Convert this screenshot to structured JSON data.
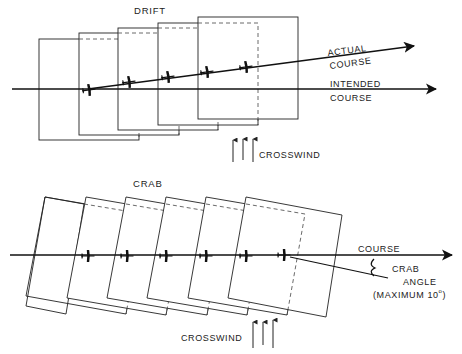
{
  "drift": {
    "title": "DRIFT",
    "actual_course_line1": "ACTUAL",
    "actual_course_line2": "COURSE",
    "intended_course_line1": "INTENDED",
    "intended_course_line2": "COURSE",
    "crosswind_label": "CROSSWIND",
    "frame_count": 5,
    "aircraft_count": 5
  },
  "crab": {
    "title": "CRAB",
    "course_label": "COURSE",
    "crab_angle_line1": "CRAB",
    "crab_angle_line2": "ANGLE",
    "crab_angle_line3": "(MAXIMUM 10",
    "crab_angle_degree": "o",
    "crab_angle_close": ")",
    "crosswind_label": "CROSSWIND",
    "frame_count": 6,
    "aircraft_count": 6
  },
  "colors": {
    "ink": "#222222",
    "background": "#ffffff"
  }
}
